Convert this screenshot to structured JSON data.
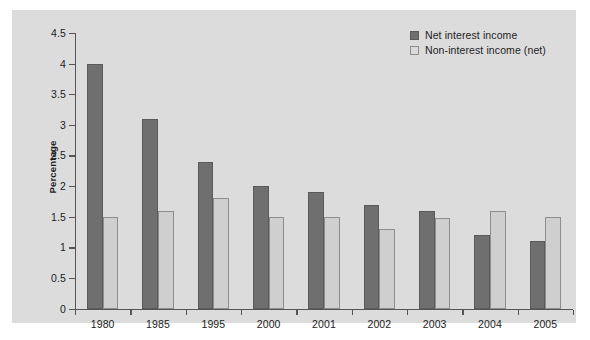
{
  "chart_data": {
    "type": "bar",
    "title": "",
    "xlabel": "",
    "ylabel": "Percentage",
    "ylim": [
      0,
      4.5
    ],
    "ytick_labels": [
      "0",
      "0.5",
      "1",
      "1.5",
      "2",
      "2.5",
      "3",
      "3.5",
      "4",
      "4.5"
    ],
    "ytick_values": [
      0,
      0.5,
      1,
      1.5,
      2,
      2.5,
      3,
      3.5,
      4,
      4.5
    ],
    "grid": false,
    "legend_position": "top-right",
    "categories": [
      "1980",
      "1985",
      "1995",
      "2000",
      "2001",
      "2002",
      "2003",
      "2004",
      "2005"
    ],
    "series": [
      {
        "name": "Net interest income",
        "color": "#6f6f6f",
        "values": [
          4.0,
          3.1,
          2.4,
          2.0,
          1.9,
          1.7,
          1.6,
          1.2,
          1.1
        ]
      },
      {
        "name": "Non-interest income (net)",
        "color": "#cfcfcf",
        "values": [
          1.5,
          1.6,
          1.8,
          1.5,
          1.5,
          1.3,
          1.48,
          1.6,
          1.5
        ]
      }
    ]
  },
  "colors": {
    "panel_background": "#dcdcdc",
    "figure_background": "#ffffff",
    "axis": "#555555",
    "text": "#1c1c1c",
    "series0": "#6f6f6f",
    "series1": "#cfcfcf"
  }
}
